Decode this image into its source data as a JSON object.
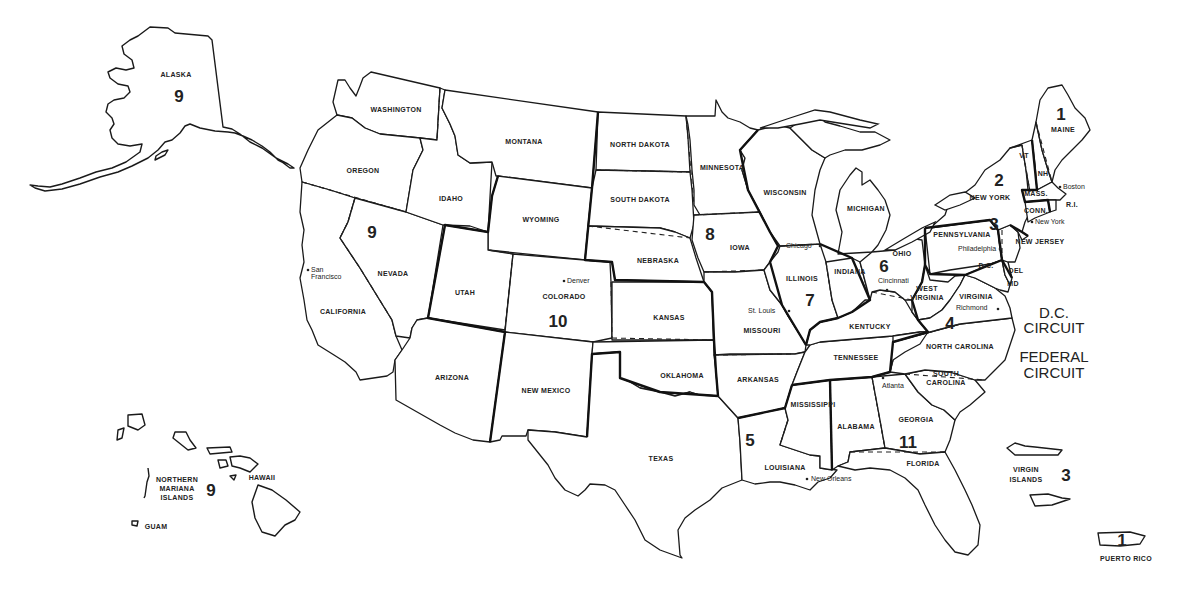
{
  "map": {
    "title": "Geographic Boundaries of United States Courts of Appeals and United States District Courts",
    "background_color": "#ffffff",
    "line_color": "#1a1a1a"
  },
  "states": {
    "alaska": "ALASKA",
    "washington": "WASHINGTON",
    "oregon": "OREGON",
    "california": "CALIFORNIA",
    "nevada": "NEVADA",
    "idaho": "IDAHO",
    "montana": "MONTANA",
    "wyoming": "WYOMING",
    "utah": "UTAH",
    "colorado": "COLORADO",
    "arizona": "ARIZONA",
    "new_mexico": "NEW MEXICO",
    "north_dakota": "NORTH DAKOTA",
    "south_dakota": "SOUTH DAKOTA",
    "nebraska": "NEBRASKA",
    "kansas": "KANSAS",
    "oklahoma": "OKLAHOMA",
    "texas": "TEXAS",
    "minnesota": "MINNESOTA",
    "iowa": "IOWA",
    "missouri": "MISSOURI",
    "arkansas": "ARKANSAS",
    "louisiana": "LOUISIANA",
    "wisconsin": "WISCONSIN",
    "illinois": "ILLINOIS",
    "indiana": "INDIANA",
    "michigan": "MICHIGAN",
    "ohio": "OHIO",
    "kentucky": "KENTUCKY",
    "tennessee": "TENNESSEE",
    "mississippi": "MISSISSIPPI",
    "alabama": "ALABAMA",
    "georgia": "GEORGIA",
    "florida": "FLORIDA",
    "south_carolina_1": "SOUTH",
    "south_carolina_2": "CAROLINA",
    "north_carolina": "NORTH CAROLINA",
    "virginia": "VIRGINIA",
    "west_virginia_1": "WEST",
    "west_virginia_2": "VIRGINIA",
    "maryland": "MD",
    "delaware": "DEL",
    "dc": "D.C.",
    "pennsylvania": "PENNSYLVANIA",
    "new_jersey": "NEW JERSEY",
    "new_york": "NEW YORK",
    "vermont": "VT",
    "new_hampshire": "NH",
    "maine": "MAINE",
    "massachusetts": "MASS.",
    "connecticut": "CONN.",
    "rhode_island": "R.I.",
    "hawaii": "HAWAII",
    "northern_mariana_1": "NORTHERN",
    "northern_mariana_2": "MARIANA",
    "northern_mariana_3": "ISLANDS",
    "guam": "GUAM",
    "virgin_islands_1": "VIRGIN",
    "virgin_islands_2": "ISLANDS",
    "puerto_rico": "PUERTO RICO"
  },
  "cities": {
    "san_francisco_1": "San",
    "san_francisco_2": "Francisco",
    "denver": "Denver",
    "st_louis": "St. Louis",
    "chicago": "Chicago",
    "cincinnati": "Cincinnati",
    "richmond": "Richmond",
    "philadelphia": "Philadelphia",
    "new_york": "New York",
    "boston": "Boston",
    "atlanta": "Atlanta",
    "new_orleans": "New Orleans"
  },
  "circuits": {
    "c1": "1",
    "c1_pr": "1",
    "c2": "2",
    "c3": "3",
    "c3_vi": "3",
    "c4": "4",
    "c5": "5",
    "c6": "6",
    "c7": "7",
    "c8": "8",
    "c9_alaska": "9",
    "c9_west": "9",
    "c9_pacific": "9",
    "c10": "10",
    "c11": "11",
    "dc_circuit_1": "D.C.",
    "dc_circuit_2": "CIRCUIT",
    "federal_circuit_1": "FEDERAL",
    "federal_circuit_2": "CIRCUIT"
  }
}
